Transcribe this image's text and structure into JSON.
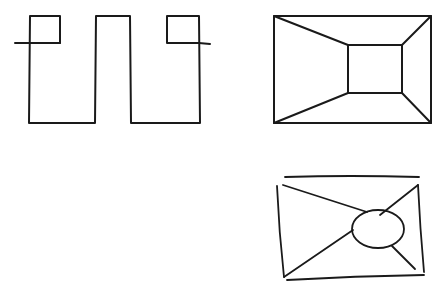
{
  "colors": {
    "background": "#ffffff",
    "stroke": "#1a1a1a"
  },
  "figures": [
    {
      "id": "meander-with-squares",
      "description": "Rectilinear meander outline with two small squares at the top corners and horizontal stub lines extending outward"
    },
    {
      "id": "perspective-room",
      "description": "Outer rectangle with an inner rectangle; corners connected diagonally (one-point perspective tunnel)"
    },
    {
      "id": "hand-drawn-envelope-ellipse",
      "description": "Hand-drawn rectangle with diagonals from corners converging on an off-center ellipse"
    }
  ]
}
